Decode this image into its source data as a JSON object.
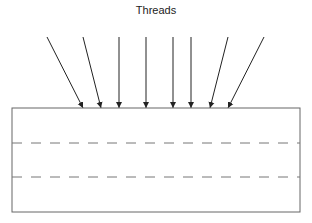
{
  "title": "Threads",
  "colors": {
    "arrow": "#222222",
    "box": "#666666",
    "dash": "#777777"
  },
  "arrows": [
    {
      "x1": 47,
      "y1": 37,
      "x2": 83,
      "y2": 108
    },
    {
      "x1": 83,
      "y1": 37,
      "x2": 101,
      "y2": 108
    },
    {
      "x1": 119,
      "y1": 37,
      "x2": 119,
      "y2": 108
    },
    {
      "x1": 146,
      "y1": 37,
      "x2": 146,
      "y2": 108
    },
    {
      "x1": 173,
      "y1": 37,
      "x2": 173,
      "y2": 108
    },
    {
      "x1": 191,
      "y1": 37,
      "x2": 191,
      "y2": 108
    },
    {
      "x1": 228,
      "y1": 37,
      "x2": 210,
      "y2": 108
    },
    {
      "x1": 264,
      "y1": 37,
      "x2": 228,
      "y2": 108
    }
  ],
  "box": {
    "x": 12,
    "y": 108,
    "width": 288,
    "height": 104
  },
  "dashed_lines": [
    143,
    177
  ]
}
